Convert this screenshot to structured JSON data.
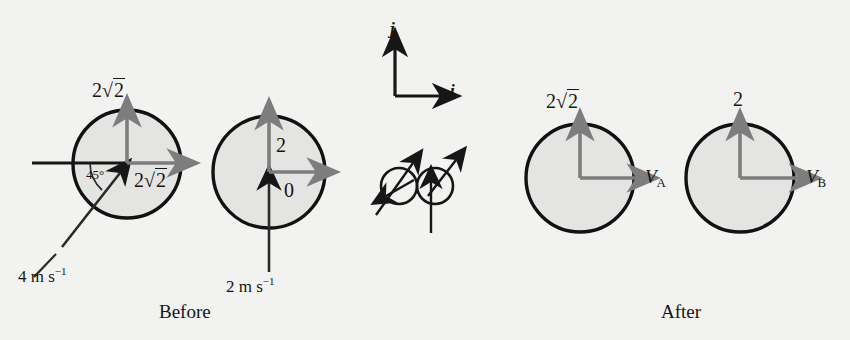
{
  "figure": {
    "kind": "physics-collision-diagram",
    "background_color": "#f2f2f0",
    "ball_fill_color": "#e4e4e2",
    "ball_outline_color": "#111111",
    "component_arrow_color": "#7d7d7d",
    "velocity_arrow_color": "#1a1a1a"
  },
  "captions": {
    "before": "Before",
    "after": "After"
  },
  "axes": {
    "j_label": "j",
    "i_label": "i"
  },
  "before": {
    "ball_a": {
      "name": "ball-a",
      "incoming_speed": "4 m s",
      "incoming_speed_exponent": "−1",
      "angle_label": "45°",
      "vertical_component": {
        "coefficient": "2",
        "radical": "2"
      },
      "horizontal_component": {
        "coefficient": "2",
        "radical": "2"
      }
    },
    "ball_b": {
      "name": "ball-b",
      "incoming_speed": "2 m s",
      "incoming_speed_exponent": "−1",
      "vertical_component": "2",
      "horizontal_component": "0"
    }
  },
  "after": {
    "ball_a": {
      "name": "ball-a",
      "vertical_component": {
        "coefficient": "2",
        "radical": "2"
      },
      "velocity_symbol": "V",
      "velocity_subscript": "A"
    },
    "ball_b": {
      "name": "ball-b",
      "vertical_component": "2",
      "velocity_symbol": "V",
      "velocity_subscript": "B"
    }
  },
  "collision_detail": {
    "label": "collision-contact-detail",
    "ball_count": 2
  }
}
